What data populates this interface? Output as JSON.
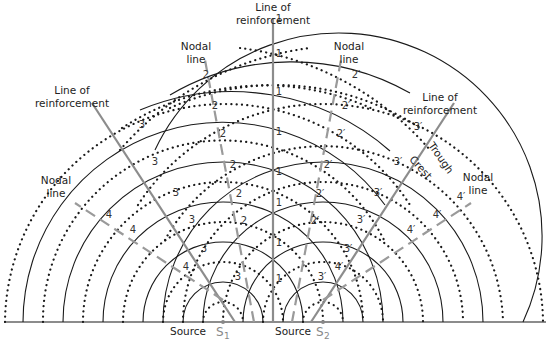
{
  "figure": {
    "type": "two-source interference pattern",
    "sources": [
      {
        "label": "Source",
        "name": "S",
        "subscript": "1"
      },
      {
        "label": "Source",
        "name": "S",
        "subscript": "2"
      }
    ],
    "labels": {
      "center_line_1": "Line of",
      "center_line_2": "reinforcement",
      "left_reinf_1": "Line of",
      "left_reinf_2": "reinforcement",
      "right_reinf_1": "Line of",
      "right_reinf_2": "reinforcement",
      "left_nodal_1": "Nodal",
      "left_nodal_2": "line",
      "left_inner_nodal_1": "Nodal",
      "left_inner_nodal_2": "line",
      "right_inner_nodal_1": "Nodal",
      "right_inner_nodal_2": "line",
      "right_nodal_1": "Nodal",
      "right_nodal_2": "line",
      "trough": "Trough",
      "crest": "Crest"
    },
    "legend": {
      "solid_arc": "Crest",
      "dotted_arc": "Trough",
      "solid_grey_line": "Line of reinforcement",
      "dashed_grey_line": "Nodal line"
    },
    "path_difference_numbers": {
      "center": [
        "1",
        "1",
        "1",
        "1",
        "1",
        "1",
        "1",
        "1"
      ],
      "left_nodal_inner": [
        "2",
        "2",
        "2",
        "2",
        "2",
        "2"
      ],
      "left_reinf": [
        "3",
        "3",
        "3",
        "3",
        "3",
        "3"
      ],
      "left_nodal_outer": [
        "4",
        "4",
        "4",
        "4"
      ],
      "right_nodal_inner": [
        "2′",
        "2′",
        "2′",
        "2′",
        "2′",
        "2′"
      ],
      "right_reinf": [
        "3′",
        "3′",
        "3′",
        "3′",
        "3′",
        "3′"
      ],
      "right_nodal_outer": [
        "4′",
        "4′",
        "4′",
        "4′"
      ]
    }
  }
}
